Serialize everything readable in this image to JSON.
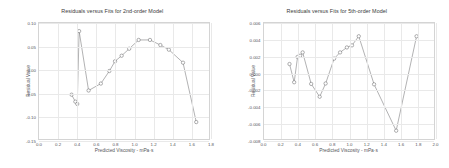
{
  "figure": {
    "background_color": "#ffffff",
    "line_color": "#6f7072",
    "marker_color": "#5d5e60",
    "grid_color": "#e9e9e9",
    "panel_count": 2
  },
  "chart_data": [
    {
      "type": "line",
      "panel_index": 0,
      "title": "Residuals versus Fits for 2nd-order Model",
      "xlabel": "Predicted Viscosity - mPa·s",
      "ylabel": "Residual Value",
      "xlim": [
        0.0,
        1.8
      ],
      "ylim": [
        -0.15,
        0.1
      ],
      "xticks": [
        0.0,
        0.2,
        0.4,
        0.6,
        0.8,
        1.0,
        1.2,
        1.4,
        1.6,
        1.8
      ],
      "xticklabels": [
        "0.0",
        "0.2",
        "0.4",
        "0.6",
        "0.8",
        "1.0",
        "1.2",
        "1.4",
        "1.6",
        "1.8"
      ],
      "yticks": [
        0.1,
        0.05,
        0.0,
        -0.05,
        -0.1,
        -0.15
      ],
      "yticklabels": [
        "0.10",
        "0.05",
        "0.00",
        "-0.05",
        "-0.10",
        "-0.15"
      ],
      "grid": true,
      "legend": "none",
      "marker": "open-circle",
      "x": [
        0.345,
        0.385,
        0.405,
        0.425,
        0.525,
        0.655,
        0.745,
        0.805,
        0.875,
        0.955,
        1.055,
        1.175,
        1.285,
        1.375,
        1.525,
        1.665
      ],
      "y": [
        -0.0545,
        -0.0695,
        -0.0745,
        0.0825,
        -0.0455,
        -0.0305,
        -0.0035,
        0.0175,
        0.0295,
        0.0445,
        0.0635,
        0.0635,
        0.0525,
        0.0425,
        0.0145,
        -0.1135
      ],
      "series": [
        {
          "name": "residuals-2nd-order",
          "points": [
            {
              "x": 0.345,
              "y": -0.0545
            },
            {
              "x": 0.385,
              "y": -0.0695
            },
            {
              "x": 0.405,
              "y": -0.0745
            },
            {
              "x": 0.425,
              "y": 0.0825
            },
            {
              "x": 0.525,
              "y": -0.0455
            },
            {
              "x": 0.655,
              "y": -0.0305
            },
            {
              "x": 0.745,
              "y": -0.0035
            },
            {
              "x": 0.805,
              "y": 0.0175
            },
            {
              "x": 0.875,
              "y": 0.0295
            },
            {
              "x": 0.955,
              "y": 0.0445
            },
            {
              "x": 1.055,
              "y": 0.0635
            },
            {
              "x": 1.175,
              "y": 0.0635
            },
            {
              "x": 1.285,
              "y": 0.0525
            },
            {
              "x": 1.375,
              "y": 0.0425
            },
            {
              "x": 1.525,
              "y": 0.0145
            },
            {
              "x": 1.665,
              "y": -0.1135
            }
          ]
        }
      ]
    },
    {
      "type": "line",
      "panel_index": 1,
      "title": "Residuals versus Fits for 5th-order Model",
      "xlabel": "Predicted Viscosity - mPa·s",
      "ylabel": "Residual Value",
      "xlim": [
        0.0,
        2.0
      ],
      "ylim": [
        -0.008,
        0.006
      ],
      "xticks": [
        0.0,
        0.2,
        0.4,
        0.6,
        0.8,
        1.0,
        1.2,
        1.4,
        1.6,
        1.8,
        2.0
      ],
      "xticklabels": [
        "0.0",
        "0.2",
        "0.4",
        "0.6",
        "0.8",
        "1.0",
        "1.2",
        "1.4",
        "1.6",
        "1.8",
        "2.0"
      ],
      "yticks": [
        0.006,
        0.004,
        0.002,
        0.0,
        -0.002,
        -0.004,
        -0.006,
        -0.008
      ],
      "yticklabels": [
        "0.006",
        "0.004",
        "0.002",
        "0.000",
        "-0.002",
        "-0.004",
        "-0.006",
        "-0.008"
      ],
      "grid": true,
      "legend": "none",
      "marker": "open-circle",
      "x": [
        0.3,
        0.355,
        0.395,
        0.425,
        0.455,
        0.555,
        0.655,
        0.725,
        0.825,
        0.895,
        0.975,
        1.035,
        1.115,
        1.295,
        1.555,
        1.795
      ],
      "y": [
        0.00105,
        -0.00115,
        0.0019,
        0.00205,
        0.00245,
        -0.00135,
        -0.0029,
        -0.0013,
        0.0017,
        0.00245,
        0.00305,
        0.0033,
        0.0044,
        -0.0014,
        -0.007,
        0.0044
      ],
      "series": [
        {
          "name": "residuals-5th-order",
          "points": [
            {
              "x": 0.3,
              "y": 0.00105
            },
            {
              "x": 0.355,
              "y": -0.00115
            },
            {
              "x": 0.395,
              "y": 0.0019
            },
            {
              "x": 0.425,
              "y": 0.00205
            },
            {
              "x": 0.455,
              "y": 0.00245
            },
            {
              "x": 0.555,
              "y": -0.00135
            },
            {
              "x": 0.655,
              "y": -0.0029
            },
            {
              "x": 0.725,
              "y": -0.0013
            },
            {
              "x": 0.825,
              "y": 0.0017
            },
            {
              "x": 0.895,
              "y": 0.00245
            },
            {
              "x": 0.975,
              "y": 0.00305
            },
            {
              "x": 1.035,
              "y": 0.0033
            },
            {
              "x": 1.115,
              "y": 0.0044
            },
            {
              "x": 1.295,
              "y": -0.0014
            },
            {
              "x": 1.555,
              "y": -0.007
            },
            {
              "x": 1.795,
              "y": 0.0044
            }
          ]
        }
      ]
    }
  ]
}
